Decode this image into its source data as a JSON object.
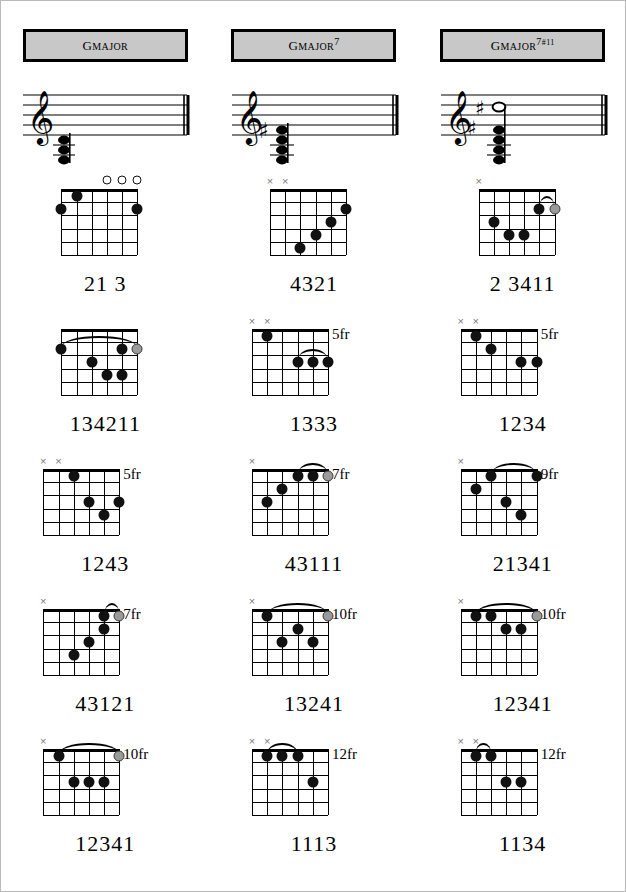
{
  "headers": [
    {
      "root": "G",
      "quality": "MAJOR",
      "ext": "",
      "alt": ""
    },
    {
      "root": "G",
      "quality": "MAJOR",
      "ext": "7",
      "alt": ""
    },
    {
      "root": "G",
      "quality": "MAJOR",
      "ext": "7",
      "alt": "#11"
    }
  ],
  "columns": [
    "G MAJOR",
    "G MAJOR 7",
    "G MAJOR 7#11"
  ],
  "notation": [
    {
      "clef": "treble-clef",
      "accidentals": 0,
      "voices": 3,
      "label": "G major triad"
    },
    {
      "clef": "treble-clef",
      "accidentals": 1,
      "voices": 4,
      "label": "G major 7"
    },
    {
      "clef": "treble-clef",
      "accidentals": 2,
      "voices": 4,
      "label": "G major 7 sharp 11"
    }
  ],
  "chords": [
    [
      {
        "name": "G major open position",
        "fret_label": "",
        "frets": 5,
        "markers": [
          "",
          "",
          "",
          "open",
          "open",
          "open"
        ],
        "dots": [
          {
            "string": 1,
            "fret": 2,
            "type": "solid"
          },
          {
            "string": 2,
            "fret": 1,
            "type": "solid"
          },
          {
            "string": 6,
            "fret": 2,
            "type": "solid"
          }
        ],
        "barre": null,
        "fingering": "21    3"
      },
      {
        "name": "G major 7 diagonal shape",
        "fret_label": "",
        "frets": 5,
        "markers": [
          "mute",
          "mute",
          "",
          "",
          "",
          ""
        ],
        "dots": [
          {
            "string": 3,
            "fret": 5,
            "type": "solid"
          },
          {
            "string": 4,
            "fret": 4,
            "type": "solid"
          },
          {
            "string": 5,
            "fret": 3,
            "type": "solid"
          },
          {
            "string": 6,
            "fret": 2,
            "type": "solid"
          }
        ],
        "barre": null,
        "fingering": "4321"
      },
      {
        "name": "G major 7 sharp 11 open shape",
        "fret_label": "",
        "frets": 5,
        "markers": [
          "mute",
          "",
          "",
          "",
          "",
          ""
        ],
        "dots": [
          {
            "string": 2,
            "fret": 3,
            "type": "solid"
          },
          {
            "string": 3,
            "fret": 4,
            "type": "solid"
          },
          {
            "string": 4,
            "fret": 4,
            "type": "solid"
          },
          {
            "string": 5,
            "fret": 2,
            "type": "solid"
          },
          {
            "string": 6,
            "fret": 2,
            "type": "grey"
          }
        ],
        "barre": {
          "from": 5,
          "to": 6,
          "fret": 2
        },
        "fingering": "2 3411"
      }
    ],
    [
      {
        "name": "G major barre chord 3rd fret",
        "fret_label": "",
        "frets": 5,
        "markers": [
          "",
          "",
          "",
          "",
          "",
          ""
        ],
        "dots": [
          {
            "string": 1,
            "fret": 2,
            "type": "solid"
          },
          {
            "string": 3,
            "fret": 3,
            "type": "solid"
          },
          {
            "string": 4,
            "fret": 4,
            "type": "solid"
          },
          {
            "string": 5,
            "fret": 4,
            "type": "solid"
          },
          {
            "string": 5,
            "fret": 2,
            "type": "solid"
          },
          {
            "string": 6,
            "fret": 2,
            "type": "grey"
          }
        ],
        "barre": {
          "from": 1,
          "to": 6,
          "fret": 2
        },
        "fingering": "134211"
      },
      {
        "name": "G major 7 fifth fret",
        "fret_label": "5fr",
        "frets": 5,
        "markers": [
          "mute",
          "mute",
          "",
          "",
          "",
          ""
        ],
        "dots": [
          {
            "string": 2,
            "fret": 1,
            "type": "solid"
          },
          {
            "string": 4,
            "fret": 3,
            "type": "solid"
          },
          {
            "string": 5,
            "fret": 3,
            "type": "solid"
          },
          {
            "string": 6,
            "fret": 3,
            "type": "solid"
          }
        ],
        "barre": {
          "from": 4,
          "to": 6,
          "fret": 3
        },
        "fingering": "1333"
      },
      {
        "name": "G major 7 sharp 11 fifth fret",
        "fret_label": "5fr",
        "frets": 5,
        "markers": [
          "mute",
          "mute",
          "",
          "",
          "",
          ""
        ],
        "dots": [
          {
            "string": 2,
            "fret": 1,
            "type": "solid"
          },
          {
            "string": 3,
            "fret": 2,
            "type": "solid"
          },
          {
            "string": 5,
            "fret": 3,
            "type": "solid"
          },
          {
            "string": 6,
            "fret": 3,
            "type": "solid"
          }
        ],
        "barre": null,
        "fingering": "1234"
      }
    ],
    [
      {
        "name": "G major fifth fret shape",
        "fret_label": "5fr",
        "frets": 5,
        "markers": [
          "mute",
          "mute",
          "",
          "",
          "",
          ""
        ],
        "dots": [
          {
            "string": 3,
            "fret": 1,
            "type": "solid"
          },
          {
            "string": 4,
            "fret": 3,
            "type": "solid"
          },
          {
            "string": 5,
            "fret": 4,
            "type": "solid"
          },
          {
            "string": 6,
            "fret": 3,
            "type": "solid"
          }
        ],
        "barre": null,
        "fingering": "1243"
      },
      {
        "name": "G major 7 seventh fret",
        "fret_label": "7fr",
        "frets": 5,
        "markers": [
          "mute",
          "",
          "",
          "",
          "",
          ""
        ],
        "dots": [
          {
            "string": 2,
            "fret": 3,
            "type": "solid"
          },
          {
            "string": 3,
            "fret": 2,
            "type": "solid"
          },
          {
            "string": 4,
            "fret": 1,
            "type": "solid"
          },
          {
            "string": 5,
            "fret": 1,
            "type": "solid"
          },
          {
            "string": 6,
            "fret": 1,
            "type": "grey"
          }
        ],
        "barre": {
          "from": 4,
          "to": 6,
          "fret": 1
        },
        "fingering": "43111"
      },
      {
        "name": "G major 7 sharp 11 ninth fret",
        "fret_label": "9fr",
        "frets": 5,
        "markers": [
          "mute",
          "",
          "",
          "",
          "",
          ""
        ],
        "dots": [
          {
            "string": 2,
            "fret": 2,
            "type": "solid"
          },
          {
            "string": 3,
            "fret": 1,
            "type": "solid"
          },
          {
            "string": 4,
            "fret": 3,
            "type": "solid"
          },
          {
            "string": 5,
            "fret": 4,
            "type": "solid"
          },
          {
            "string": 6,
            "fret": 1,
            "type": "solid"
          }
        ],
        "barre": {
          "from": 3,
          "to": 6,
          "fret": 1
        },
        "fingering": "21341"
      }
    ],
    [
      {
        "name": "G major seventh fret shape",
        "fret_label": "7fr",
        "frets": 5,
        "markers": [
          "mute",
          "",
          "",
          "",
          "",
          ""
        ],
        "dots": [
          {
            "string": 3,
            "fret": 4,
            "type": "solid"
          },
          {
            "string": 4,
            "fret": 3,
            "type": "solid"
          },
          {
            "string": 5,
            "fret": 1,
            "type": "solid"
          },
          {
            "string": 5,
            "fret": 2,
            "type": "solid"
          },
          {
            "string": 6,
            "fret": 1,
            "type": "grey"
          }
        ],
        "barre": {
          "from": 5,
          "to": 6,
          "fret": 1
        },
        "fingering": "43121"
      },
      {
        "name": "G major 7 tenth fret",
        "fret_label": "10fr",
        "frets": 5,
        "markers": [
          "mute",
          "",
          "",
          "",
          "",
          ""
        ],
        "dots": [
          {
            "string": 2,
            "fret": 1,
            "type": "solid"
          },
          {
            "string": 3,
            "fret": 3,
            "type": "solid"
          },
          {
            "string": 4,
            "fret": 2,
            "type": "solid"
          },
          {
            "string": 5,
            "fret": 3,
            "type": "solid"
          },
          {
            "string": 6,
            "fret": 1,
            "type": "grey"
          }
        ],
        "barre": {
          "from": 2,
          "to": 6,
          "fret": 1
        },
        "fingering": "13241"
      },
      {
        "name": "G major 7 sharp 11 tenth fret",
        "fret_label": "10fr",
        "frets": 5,
        "markers": [
          "mute",
          "",
          "",
          "",
          "",
          ""
        ],
        "dots": [
          {
            "string": 2,
            "fret": 1,
            "type": "solid"
          },
          {
            "string": 3,
            "fret": 1,
            "type": "solid"
          },
          {
            "string": 4,
            "fret": 2,
            "type": "solid"
          },
          {
            "string": 5,
            "fret": 2,
            "type": "solid"
          },
          {
            "string": 6,
            "fret": 1,
            "type": "grey"
          }
        ],
        "barre": {
          "from": 2,
          "to": 6,
          "fret": 1
        },
        "fingering": "12341"
      }
    ],
    [
      {
        "name": "G major tenth fret shape",
        "fret_label": "10fr",
        "frets": 5,
        "markers": [
          "mute",
          "",
          "",
          "",
          "",
          ""
        ],
        "dots": [
          {
            "string": 2,
            "fret": 1,
            "type": "solid"
          },
          {
            "string": 3,
            "fret": 3,
            "type": "solid"
          },
          {
            "string": 4,
            "fret": 3,
            "type": "solid"
          },
          {
            "string": 5,
            "fret": 3,
            "type": "solid"
          },
          {
            "string": 6,
            "fret": 1,
            "type": "grey"
          }
        ],
        "barre": {
          "from": 2,
          "to": 6,
          "fret": 1
        },
        "fingering": "12341"
      },
      {
        "name": "G major 7 twelfth fret",
        "fret_label": "12fr",
        "frets": 5,
        "markers": [
          "mute",
          "mute",
          "",
          "",
          "",
          ""
        ],
        "dots": [
          {
            "string": 2,
            "fret": 1,
            "type": "solid"
          },
          {
            "string": 3,
            "fret": 1,
            "type": "solid"
          },
          {
            "string": 4,
            "fret": 1,
            "type": "solid"
          },
          {
            "string": 5,
            "fret": 3,
            "type": "solid"
          }
        ],
        "barre": {
          "from": 2,
          "to": 4,
          "fret": 1
        },
        "fingering": "1113"
      },
      {
        "name": "G major 7 sharp 11 twelfth fret",
        "fret_label": "12fr",
        "frets": 5,
        "markers": [
          "mute",
          "mute",
          "",
          "",
          "",
          ""
        ],
        "dots": [
          {
            "string": 2,
            "fret": 1,
            "type": "solid"
          },
          {
            "string": 3,
            "fret": 1,
            "type": "solid"
          },
          {
            "string": 4,
            "fret": 3,
            "type": "solid"
          },
          {
            "string": 5,
            "fret": 3,
            "type": "solid"
          }
        ],
        "barre": {
          "from": 2,
          "to": 3,
          "fret": 1
        },
        "fingering": "1134"
      }
    ]
  ]
}
